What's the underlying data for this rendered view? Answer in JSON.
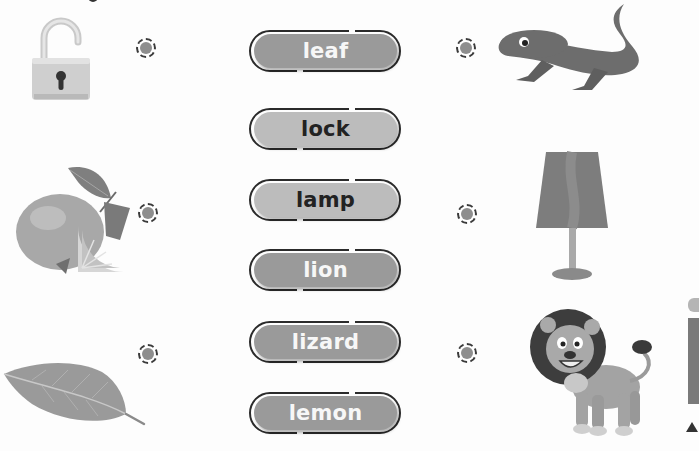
{
  "worksheet": {
    "title_fragment": "",
    "left_pictures": [
      {
        "name": "lock",
        "icon": "open-padlock-icon"
      },
      {
        "name": "lemon",
        "icon": "lemon-icon"
      },
      {
        "name": "leaf",
        "icon": "leaf-icon"
      }
    ],
    "words": [
      {
        "label": "leaf",
        "style": "dark"
      },
      {
        "label": "lock",
        "style": "light"
      },
      {
        "label": "lamp",
        "style": "light"
      },
      {
        "label": "lion",
        "style": "dark"
      },
      {
        "label": "lizard",
        "style": "dark"
      },
      {
        "label": "lemon",
        "style": "dark"
      }
    ],
    "right_pictures": [
      {
        "name": "lizard",
        "icon": "lizard-icon"
      },
      {
        "name": "lamp",
        "icon": "lamp-icon"
      },
      {
        "name": "lion",
        "icon": "lion-icon"
      }
    ],
    "colors": {
      "pill_dark": "#9a9a9a",
      "pill_light": "#bcbcbc",
      "outline": "#2b2b2b",
      "dot_fill": "#8e8e8e"
    }
  }
}
